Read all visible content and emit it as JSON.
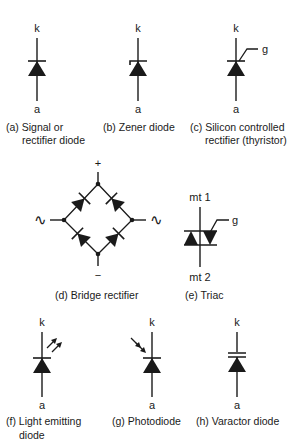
{
  "figure": {
    "symbols": {
      "a": {
        "terminals": {
          "top": "k",
          "bottom": "a"
        },
        "caption_line1": "(a) Signal or",
        "caption_line2": "rectifier diode"
      },
      "b": {
        "terminals": {
          "top": "k",
          "bottom": "a"
        },
        "caption_line1": "(b) Zener diode"
      },
      "c": {
        "terminals": {
          "top": "k",
          "bottom": "a",
          "gate": "g"
        },
        "caption_line1": "(c) Silicon controlled",
        "caption_line2": "rectifier (thyristor)"
      },
      "d": {
        "terminals": {
          "plus": "+",
          "minus": "−",
          "ac_left": "∿",
          "ac_right": "∿"
        },
        "caption_line1": "(d) Bridge rectifier"
      },
      "e": {
        "terminals": {
          "top": "mt 1",
          "bottom": "mt 2",
          "gate": "g"
        },
        "caption_line1": "(e) Triac"
      },
      "f": {
        "terminals": {
          "top": "k",
          "bottom": "a"
        },
        "caption_line1": "(f) Light emitting",
        "caption_line2": "diode"
      },
      "g": {
        "terminals": {
          "top": "k",
          "bottom": "a"
        },
        "caption_line1": "(g) Photodiode"
      },
      "h": {
        "terminals": {
          "top": "k",
          "bottom": "a"
        },
        "caption_line1": "(h) Varactor diode"
      }
    },
    "colors": {
      "ink": "#1a1a1a",
      "background": "#ffffff"
    }
  }
}
